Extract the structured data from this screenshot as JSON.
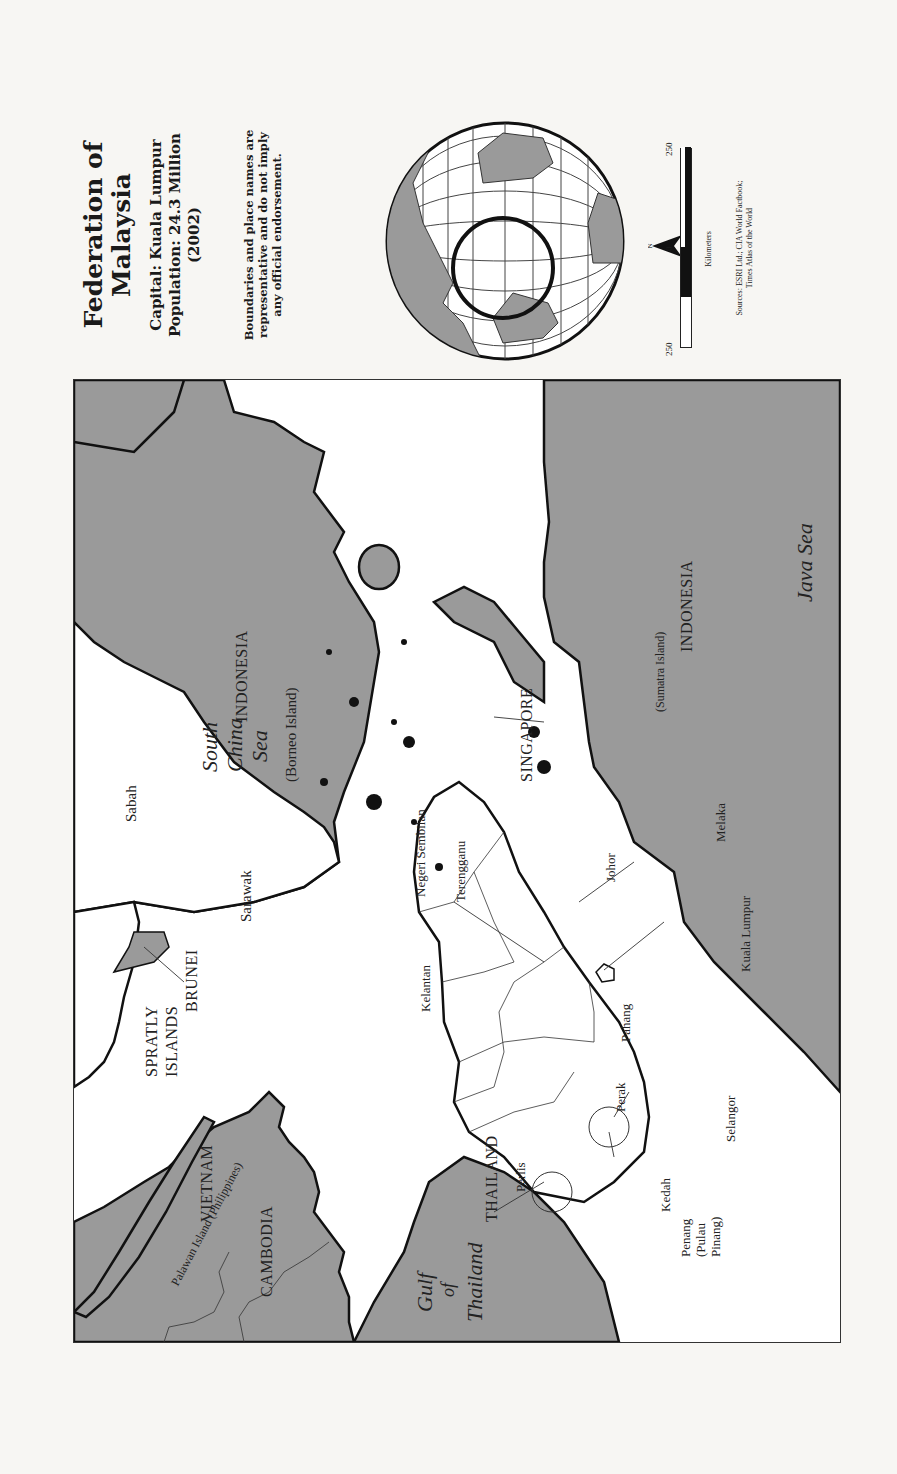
{
  "title_block": {
    "title_line1": "Federation of",
    "title_line2": "Malaysia",
    "capital": "Capital: Kuala Lumpur",
    "population": "Population: 24.3 Million",
    "population_year": "(2002)",
    "disclaimer_line1": "Boundaries and place names are",
    "disclaimer_line2": "representative and do not imply",
    "disclaimer_line3": "any official endorsement."
  },
  "scale_bar": {
    "left_label": "250",
    "center_label": "0",
    "right_label": "250",
    "unit": "Kilometers"
  },
  "north_arrow": {
    "label": "N"
  },
  "sources": {
    "line1": "Sources: ESRI Ltd.; CIA World Factbook;",
    "line2": "Times Atlas of the World"
  },
  "colors": {
    "land_other": "#9a9a9a",
    "land_malaysia": "#ffffff",
    "water": "#ffffff",
    "coastline": "#111111",
    "paper": "#f7f6f3"
  },
  "map_labels": {
    "countries": {
      "cambodia": "CAMBODIA",
      "vietnam": "VIETNAM",
      "thailand": "THAILAND",
      "singapore": "SINGAPORE",
      "brunei": "BRUNEI",
      "indonesia_borneo": "INDONESIA",
      "indonesia_sumatra": "INDONESIA",
      "spratly_1": "SPRATLY",
      "spratly_2": "ISLANDS"
    },
    "water": {
      "gulf_1": "Gulf",
      "gulf_2": "of",
      "gulf_3": "Thailand",
      "scs_1": "South",
      "scs_2": "China",
      "scs_3": "Sea",
      "java_sea": "Java Sea"
    },
    "islands": {
      "borneo": "(Borneo Island)",
      "sumatra": "(Sumatra Island)",
      "palawan": "Palawan Island (Philippines)"
    },
    "states": {
      "perlis": "Perlis",
      "kedah": "Kedah",
      "penang_1": "Penang",
      "penang_2": "(Pulau",
      "penang_3": "Pinang)",
      "perak": "Perak",
      "selangor": "Selangor",
      "kelantan": "Kelantan",
      "terengganu": "Terengganu",
      "pahang": "Pahang",
      "negeri_sembilan": "Negeri Sembilan",
      "johor": "Johor",
      "melaka": "Melaka",
      "kuala_lumpur": "Kuala Lumpur",
      "sabah": "Sabah",
      "sarawak": "Sarawak"
    }
  }
}
